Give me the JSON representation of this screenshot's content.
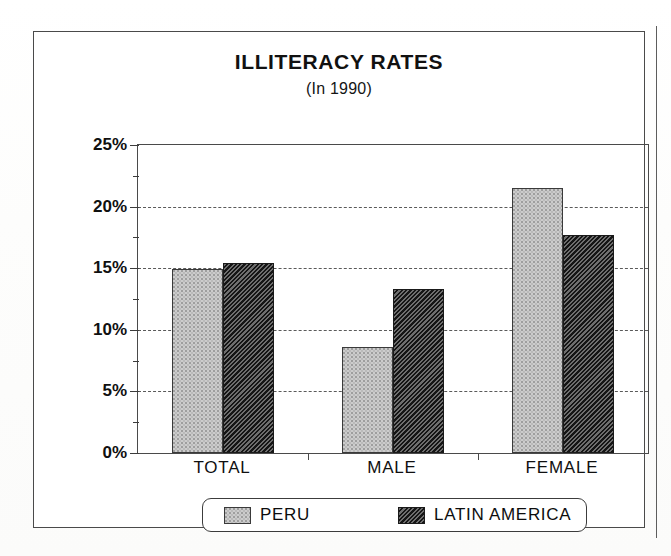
{
  "chart_data": {
    "type": "bar",
    "title": "ILLITERACY RATES",
    "subtitle": "(In 1990)",
    "xlabel": "",
    "ylabel": "",
    "categories": [
      "TOTAL",
      "MALE",
      "FEMALE"
    ],
    "series": [
      {
        "name": "PERU",
        "values": [
          14.9,
          8.6,
          21.5
        ],
        "fill": "light-gray-stipple",
        "color": "#cccccc"
      },
      {
        "name": "LATIN AMERICA",
        "values": [
          15.4,
          13.3,
          17.7
        ],
        "fill": "dark-diagonal-hatch",
        "color": "#2b2b2b"
      }
    ],
    "ylim": [
      0,
      25
    ],
    "ytick_labels": [
      "0%",
      "5%",
      "10%",
      "15%",
      "20%",
      "25%"
    ],
    "ytick_values": [
      0,
      5,
      10,
      15,
      20,
      25
    ],
    "yminor_tick_values": [
      2.5,
      7.5,
      12.5,
      17.5,
      22.5
    ],
    "gridline_values": [
      5,
      10,
      15,
      20
    ],
    "grid": true,
    "legend_position": "bottom",
    "value_unit": "percent"
  },
  "legend": {
    "entries": [
      {
        "label": "PERU",
        "swatch": "peru-swatch"
      },
      {
        "label": "LATIN AMERICA",
        "swatch": "latin-america-swatch"
      }
    ]
  },
  "colors": {
    "peru_fill": "#cccccc",
    "latin_america_fill": "#2b2b2b",
    "axis": "#4a4a4a",
    "grid": "#5a5a5a",
    "text": "#101010",
    "frame": "#4a4a4a"
  }
}
